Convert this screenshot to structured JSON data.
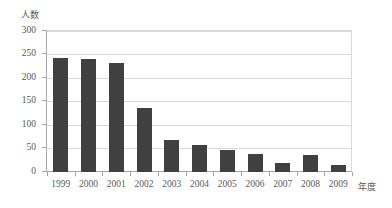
{
  "chart_data": {
    "type": "bar",
    "title": "",
    "subtitle": "",
    "xlabel": "年度",
    "ylabel": "人数",
    "categories": [
      "1999",
      "2000",
      "2001",
      "2002",
      "2003",
      "2004",
      "2005",
      "2006",
      "2007",
      "2008",
      "2009"
    ],
    "values": [
      240,
      238,
      230,
      135,
      68,
      58,
      47,
      38,
      20,
      35,
      15
    ],
    "series": [
      {
        "name": "人数",
        "values": [
          240,
          238,
          230,
          135,
          68,
          58,
          47,
          38,
          20,
          35,
          15
        ]
      }
    ],
    "ylim": [
      0,
      300
    ],
    "ytick_values": [
      0,
      50,
      100,
      150,
      200,
      250,
      300
    ],
    "ytick_labels": [
      "0",
      "50",
      "100",
      "150",
      "200",
      "250",
      "300"
    ],
    "grid": "horizontal",
    "legend": "none",
    "bar_color": "#404040",
    "gridline_color": "#d9d9d9",
    "axis_color": "#a6a6a6",
    "text_color": "#595959",
    "background_color": "#ffffff",
    "annotations": []
  }
}
